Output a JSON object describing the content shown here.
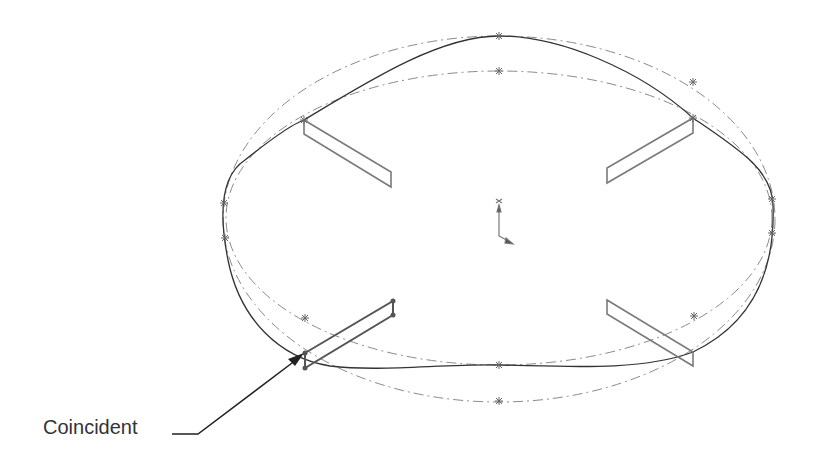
{
  "diagram": {
    "type": "CAD sketch",
    "callout": {
      "label": "Coincident"
    },
    "colors": {
      "spline": "#333333",
      "construction": "#8a8a8a",
      "slots": "#7a7a7a",
      "points": "#666666",
      "callout": "#222222"
    },
    "elements": [
      "spline-closed",
      "construction-ellipse-outer",
      "construction-ellipse-inner",
      "slot-top-left",
      "slot-top-right",
      "slot-bottom-left",
      "slot-bottom-right",
      "origin-axes"
    ]
  }
}
